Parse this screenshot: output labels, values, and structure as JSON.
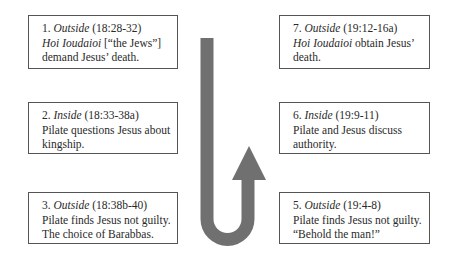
{
  "diagram": {
    "type": "chiastic-structure",
    "arrow": {
      "shape": "u-turn",
      "direction": "down-then-up",
      "color": "#707070"
    },
    "left_column": [
      {
        "number": "1.",
        "setting": "Outside",
        "reference": "(18:28-32)",
        "lines": [
          {
            "italic": "Hoi Ioudaioi",
            "text": " [“the Jews”]"
          },
          {
            "italic": "",
            "text": "demand Jesus’ death."
          }
        ]
      },
      {
        "number": "2.",
        "setting": "Inside",
        "reference": "(18:33-38a)",
        "lines": [
          {
            "italic": "",
            "text": "Pilate questions Jesus about"
          },
          {
            "italic": "",
            "text": "kingship."
          }
        ]
      },
      {
        "number": "3.",
        "setting": "Outside",
        "reference": "(18:38b-40)",
        "lines": [
          {
            "italic": "",
            "text": "Pilate finds Jesus not guilty."
          },
          {
            "italic": "",
            "text": "The choice of Barabbas."
          }
        ]
      }
    ],
    "right_column": [
      {
        "number": "7.",
        "setting": "Outside",
        "reference": "(19:12-16a)",
        "lines": [
          {
            "italic": "Hoi Ioudaioi",
            "text": " obtain Jesus’"
          },
          {
            "italic": "",
            "text": "death."
          }
        ]
      },
      {
        "number": "6.",
        "setting": "Inside",
        "reference": "(19:9-11)",
        "lines": [
          {
            "italic": "",
            "text": "Pilate and Jesus discuss"
          },
          {
            "italic": "",
            "text": "authority."
          }
        ]
      },
      {
        "number": "5.",
        "setting": "Outside",
        "reference": "(19:4-8)",
        "lines": [
          {
            "italic": "",
            "text": "Pilate finds Jesus not guilty."
          },
          {
            "italic": "",
            "text": "“Behold the man!”"
          }
        ]
      }
    ]
  }
}
